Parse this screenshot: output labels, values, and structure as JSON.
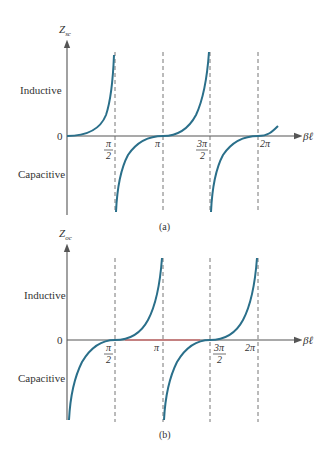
{
  "figure": {
    "colors": {
      "curve": "#2a6f8a",
      "axis": "#555555",
      "dash": "#666666",
      "highlight": "#e05a5a",
      "text": "#333333"
    },
    "panel_a": {
      "y_axis_label_main": "Z",
      "y_axis_label_sub": "sc",
      "x_axis_label": "βℓ",
      "upper_region_label": "Inductive",
      "lower_region_label": "Capacitive",
      "zero_label": "0",
      "ticks": [
        {
          "num": "π",
          "den": "2"
        },
        {
          "num": "π",
          "den": ""
        },
        {
          "num": "3π",
          "den": "2"
        },
        {
          "num": "2π",
          "den": ""
        }
      ],
      "caption": "(a)",
      "function": "Z_sc ∝ tan(βℓ)"
    },
    "panel_b": {
      "y_axis_label_main": "Z",
      "y_axis_label_sub": "oc",
      "x_axis_label": "βℓ",
      "upper_region_label": "Inductive",
      "lower_region_label": "Capacitive",
      "zero_label": "0",
      "ticks": [
        {
          "num": "π",
          "den": "2"
        },
        {
          "num": "π",
          "den": ""
        },
        {
          "num": "3π",
          "den": "2"
        },
        {
          "num": "2π",
          "den": ""
        }
      ],
      "caption": "(b)",
      "function": "Z_oc ∝ -cot(βℓ)"
    }
  }
}
